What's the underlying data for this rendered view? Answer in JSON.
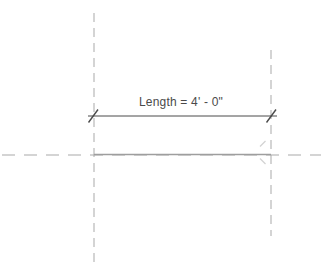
{
  "canvas": {
    "background": "#ffffff"
  },
  "dimension": {
    "label": "Length = 4' - 0\"",
    "color": "#4a4a4a"
  },
  "reference_planes": {
    "color": "#a9a9a9"
  },
  "model_line": {
    "color": "#9e9e9e"
  },
  "snap_marks": {
    "color": "#d2d2d2"
  }
}
